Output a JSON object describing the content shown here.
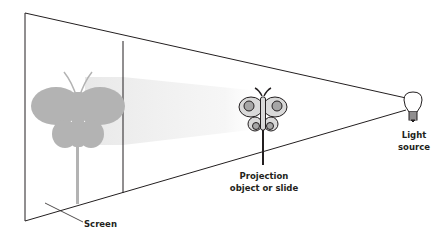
{
  "diagram": {
    "type": "projection-setup",
    "labels": {
      "screen": "Screen",
      "projection_line1": "Projection",
      "projection_line2": "object or slide",
      "light_line1": "Light",
      "light_line2": "source"
    },
    "colors": {
      "line": "#231f20",
      "shadow": "#b3b3b3",
      "beam": "#ececec",
      "wing_fill": "#d9d9d9",
      "wing_spot": "#a6a6a6",
      "background": "#ffffff"
    }
  }
}
